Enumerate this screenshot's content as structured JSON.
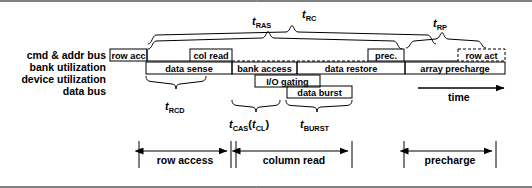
{
  "figure": {
    "time_axis_label": "time"
  },
  "row_labels": [
    {
      "id": "cmd-addr-bus",
      "text": "cmd & addr bus"
    },
    {
      "id": "bank-utilization",
      "text": "bank utilization"
    },
    {
      "id": "device-utilization",
      "text": "device utilization"
    },
    {
      "id": "data-bus",
      "text": "data bus"
    }
  ],
  "cmd_boxes": [
    {
      "id": "row-acc",
      "text": "row acc",
      "style": "solid"
    },
    {
      "id": "col-read",
      "text": "col read",
      "style": "solid"
    },
    {
      "id": "prec",
      "text": "prec.",
      "style": "solid"
    },
    {
      "id": "row-act",
      "text": "row act",
      "style": "dashed"
    }
  ],
  "bank_boxes": [
    {
      "id": "data-sense",
      "text": "data sense"
    },
    {
      "id": "bank-access",
      "text": "bank access"
    },
    {
      "id": "data-restore",
      "text": "data restore"
    },
    {
      "id": "array-precharge",
      "text": "array precharge"
    }
  ],
  "device_boxes": [
    {
      "id": "io-gating",
      "text": "I/O gating"
    }
  ],
  "data_boxes": [
    {
      "id": "data-burst",
      "text": "data burst"
    }
  ],
  "timing_params": [
    {
      "id": "t-ras",
      "base": "t",
      "sub": "RAS"
    },
    {
      "id": "t-rc",
      "base": "t",
      "sub": "RC"
    },
    {
      "id": "t-rp",
      "base": "t",
      "sub": "RP"
    },
    {
      "id": "t-rcd",
      "base": "t",
      "sub": "RCD"
    },
    {
      "id": "t-cas",
      "base": "t",
      "sub": "CAS",
      "paren_base": "t",
      "paren_sub": "CL"
    },
    {
      "id": "t-burst",
      "base": "t",
      "sub": "BURST"
    }
  ],
  "phases": [
    {
      "id": "row-access",
      "text": "row access"
    },
    {
      "id": "column-read",
      "text": "column read"
    },
    {
      "id": "precharge",
      "text": "precharge"
    }
  ],
  "colors": {
    "stroke": "#000000",
    "background": "#ffffff",
    "text": "#000000"
  }
}
